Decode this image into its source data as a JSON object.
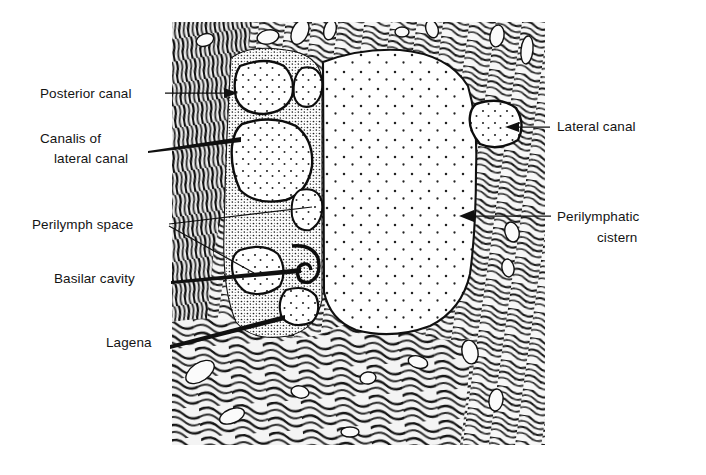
{
  "figure": {
    "kind": "anatomical-line-drawing",
    "frame": {
      "x": 172,
      "y": 22,
      "width": 373,
      "height": 423
    },
    "background_color": "#ffffff",
    "ink_color": "#101010",
    "stipple_color": "#1a1a1a"
  },
  "labels": [
    {
      "id": "posterior-canal",
      "text": "Posterior canal",
      "text_x": 40,
      "text_y": 98,
      "anchor": "start",
      "lines": [
        "Posterior canal"
      ],
      "leader": {
        "x1": 165,
        "y1": 93,
        "x2": 232,
        "y2": 93,
        "arrow": "end"
      }
    },
    {
      "id": "canalis-of-lateral-canal",
      "text": "Canalis of lateral canal",
      "text_x": 40,
      "text_y": 143,
      "anchor": "start",
      "lines": [
        "Canalis of",
        "lateral canal"
      ],
      "line_offsets": [
        0,
        20
      ],
      "line_indent": [
        0,
        14
      ],
      "leader": {
        "x1": 148,
        "y1": 150,
        "x2": 240,
        "y2": 140,
        "arrow": "none"
      }
    },
    {
      "id": "perilymph-space",
      "text": "Perilymph space",
      "text_x": 32,
      "text_y": 229,
      "anchor": "start",
      "lines": [
        "Perilymph space"
      ],
      "leader": {
        "x1": 169,
        "y1": 224,
        "x2": 310,
        "y2": 208,
        "arrow": "none"
      },
      "leader2": {
        "x1": 169,
        "y1": 226,
        "x2": 253,
        "y2": 272,
        "arrow": "none"
      }
    },
    {
      "id": "basilar-cavity",
      "text": "Basilar cavity",
      "text_x": 54,
      "text_y": 283,
      "anchor": "start",
      "lines": [
        "Basilar cavity"
      ],
      "leader": {
        "x1": 171,
        "y1": 279,
        "x2": 300,
        "y2": 271,
        "arrow": "none"
      }
    },
    {
      "id": "lagena",
      "text": "Lagena",
      "text_x": 106,
      "text_y": 347,
      "anchor": "start",
      "lines": [
        "Lagena"
      ],
      "leader": {
        "x1": 170,
        "y1": 343,
        "x2": 283,
        "y2": 318,
        "arrow": "none"
      }
    },
    {
      "id": "lateral-canal",
      "text": "Lateral canal",
      "text_x": 557,
      "text_y": 131,
      "anchor": "start",
      "lines": [
        "Lateral canal"
      ],
      "leader": {
        "x1": 548,
        "y1": 127,
        "x2": 512,
        "y2": 127,
        "arrow": "end-left"
      }
    },
    {
      "id": "perilymphatic-cistern",
      "text": "Perilymphatic cistern",
      "text_x": 557,
      "text_y": 221,
      "anchor": "start",
      "lines": [
        "Perilymphatic",
        "cistern"
      ],
      "line_offsets": [
        0,
        21
      ],
      "line_indent": [
        0,
        40
      ],
      "leader": {
        "x1": 551,
        "y1": 216,
        "x2": 464,
        "y2": 216,
        "arrow": "end-left"
      }
    }
  ],
  "structures": {
    "perilymphatic_cistern": "large central stippled chamber",
    "perilymph_spaces": "cluster of rounded chambers on the left",
    "posterior_canal": "upper-left rounded chamber",
    "canalis_of_lateral_canal": "large left chamber below posterior canal",
    "basilar_cavity": "lower-left small chamber",
    "lagena": "lower-left hook-shaped cavity",
    "lateral_canal": "right-side rounded chamber",
    "bone": "dense swirled trabecular bone texture surrounding the cavities"
  }
}
